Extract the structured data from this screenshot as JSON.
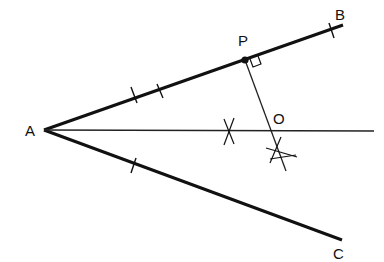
{
  "diagram": {
    "title": "",
    "labels": {
      "A": "A",
      "B": "B",
      "C": "C",
      "P": "P",
      "O": "O"
    },
    "points": {
      "A": [
        44,
        130
      ],
      "B_end": [
        343,
        25
      ],
      "C_end": [
        342,
        240
      ],
      "P": [
        245,
        60
      ],
      "O": [
        272,
        130
      ],
      "perp_end": [
        286,
        171
      ]
    },
    "marks": {
      "AB_double_ticks": true,
      "AC_single_tick": true,
      "B_tick": true,
      "right_angle_at_P": true,
      "arc_crosses": 2
    },
    "colors": {
      "ink": "#111111",
      "background": "#ffffff"
    }
  }
}
